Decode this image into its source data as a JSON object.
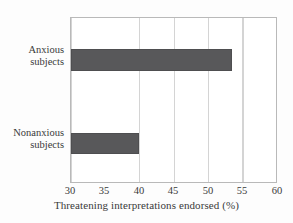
{
  "chart_data": {
    "type": "bar",
    "orientation": "horizontal",
    "title": "",
    "xlabel": "Threatening interpretations endorsed (%)",
    "ylabel": "",
    "categories": [
      "Anxious subjects",
      "Nonanxious subjects"
    ],
    "category_lines": [
      [
        "Anxious",
        "subjects"
      ],
      [
        "Nonanxious",
        "subjects"
      ]
    ],
    "values": [
      53.5,
      40.0
    ],
    "xlim": [
      30,
      60
    ],
    "xticks": [
      30,
      35,
      40,
      45,
      50,
      55,
      60
    ],
    "xtick_labels": [
      "30",
      "35",
      "40",
      "45",
      "50",
      "55",
      "60"
    ],
    "grid": "vertical",
    "legend": "none",
    "bar_color": "#58585a",
    "plot_background": "#ffffff",
    "frame_color": "#b9b9b9",
    "gridline_color": "#d4d4d4"
  }
}
